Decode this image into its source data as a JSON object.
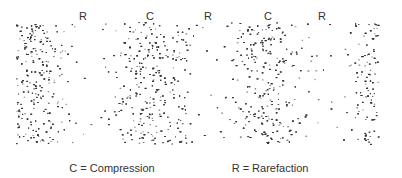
{
  "diagram": {
    "title": "",
    "region_labels": [
      {
        "text": "R",
        "x": 83,
        "meaning": "rarefaction"
      },
      {
        "text": "C",
        "x": 150,
        "meaning": "compression"
      },
      {
        "text": "R",
        "x": 208,
        "meaning": "rarefaction"
      },
      {
        "text": "C",
        "x": 268,
        "meaning": "compression"
      },
      {
        "text": "R",
        "x": 322,
        "meaning": "rarefaction"
      }
    ],
    "legend": {
      "compression": "C = Compression",
      "rarefaction": "R = Rarefaction"
    },
    "field": {
      "x0": 16,
      "x1": 378,
      "y0": 22,
      "y1": 144,
      "dense_centers": [
        24,
        150,
        268,
        372
      ],
      "sparse_centers": [
        85,
        208,
        322
      ],
      "dot_color": "#333333"
    }
  }
}
